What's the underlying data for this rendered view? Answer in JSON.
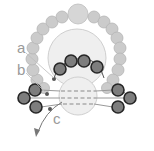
{
  "diagram": {
    "type": "beading-pattern",
    "labels": {
      "a": "a",
      "b": "b",
      "c": "c"
    },
    "colors": {
      "ring_bead": "#c9c9c9",
      "ring_stroke": "#b8b8b8",
      "large_bead": "#ececec",
      "large_stroke": "#cfcfcf",
      "dark_bead_fill": "#7a7a7a",
      "dark_bead_stroke": "#2a2a2a",
      "thread": "#9a9a9a",
      "label": "#9a9a9a"
    }
  }
}
